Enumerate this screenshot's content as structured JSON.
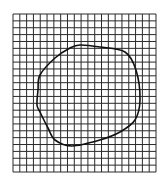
{
  "diagram": {
    "type": "grid-with-closed-curve",
    "grid": {
      "left": 13,
      "top": 14,
      "right": 156,
      "bottom": 172,
      "columns": 21,
      "rows": 23,
      "line_color": "#2a2a2a"
    },
    "curve": {
      "color": "#111111",
      "points": [
        [
          80,
          45
        ],
        [
          100,
          47
        ],
        [
          125,
          52
        ],
        [
          136,
          70
        ],
        [
          140,
          100
        ],
        [
          135,
          120
        ],
        [
          120,
          132
        ],
        [
          100,
          140
        ],
        [
          72,
          146
        ],
        [
          55,
          140
        ],
        [
          48,
          128
        ],
        [
          40,
          112
        ],
        [
          37,
          105
        ],
        [
          38,
          90
        ],
        [
          40,
          75
        ],
        [
          55,
          58
        ],
        [
          70,
          48
        ]
      ]
    }
  }
}
